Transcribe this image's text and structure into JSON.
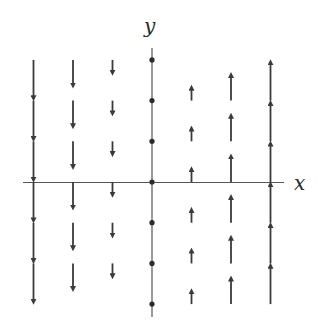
{
  "diagram": {
    "type": "vector_field",
    "axes": {
      "x_label": "x",
      "y_label": "y",
      "color": "#555555"
    },
    "colors": {
      "arrow": "#3a3a3a",
      "dot": "#2a2a2a",
      "background": "#ffffff"
    },
    "grid": {
      "x_values": [
        -3,
        -2,
        -1,
        0,
        1,
        2,
        3
      ],
      "y_values": [
        3,
        2,
        1,
        0,
        -1,
        -2,
        -3
      ]
    },
    "vectors": [
      {
        "x": -3,
        "dx": 0,
        "dy": -3
      },
      {
        "x": -2,
        "dx": 0,
        "dy": -2
      },
      {
        "x": -1,
        "dx": 0,
        "dy": -1
      },
      {
        "x": 0,
        "dx": 0,
        "dy": 0
      },
      {
        "x": 1,
        "dx": 0,
        "dy": 1
      },
      {
        "x": 2,
        "dx": 0,
        "dy": 2
      },
      {
        "x": 3,
        "dx": 0,
        "dy": 3
      }
    ]
  }
}
